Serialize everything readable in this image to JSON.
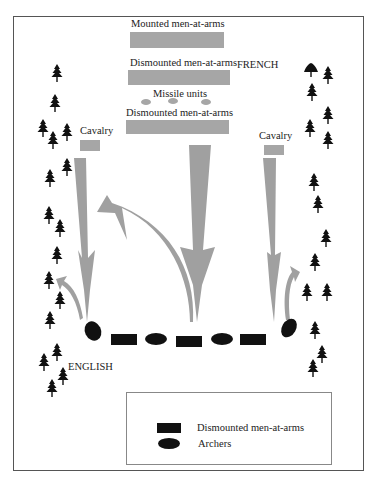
{
  "diagram": {
    "type": "battle-map",
    "colors": {
      "french_units": "#a6a6a6",
      "english_units": "#111111",
      "arrows": "#a0a0a0",
      "trees": "#111111",
      "frame": "#555555"
    },
    "french": {
      "side_label": "FRENCH",
      "lines": [
        {
          "label": "Mounted men-at-arms"
        },
        {
          "label": "Dismounted men-at-arms"
        },
        {
          "label": "Missile units"
        },
        {
          "label": "Dismounted men-at-arms"
        }
      ],
      "left_wing": {
        "label": "Cavalry"
      },
      "right_wing": {
        "label": "Cavalry"
      }
    },
    "english": {
      "side_label": "ENGLISH",
      "line": [
        "archers",
        "men-at-arms",
        "archers",
        "men-at-arms",
        "archers",
        "men-at-arms",
        "archers"
      ]
    },
    "legend": {
      "items": [
        {
          "symbol": "rectangle",
          "label": "Dismounted men-at-arms"
        },
        {
          "symbol": "ellipse",
          "label": "Archers"
        }
      ]
    },
    "trees": {
      "left": [
        [
          57,
          73
        ],
        [
          55,
          103
        ],
        [
          43,
          128
        ],
        [
          53,
          140
        ],
        [
          67,
          132
        ],
        [
          67,
          165
        ],
        [
          50,
          178
        ],
        [
          49,
          215
        ],
        [
          60,
          228
        ],
        [
          57,
          255
        ],
        [
          49,
          280
        ],
        [
          60,
          300
        ],
        [
          50,
          320
        ],
        [
          57,
          352
        ],
        [
          44,
          362
        ],
        [
          63,
          376
        ],
        [
          52,
          388
        ]
      ],
      "right": [
        [
          311,
          68
        ],
        [
          328,
          75
        ],
        [
          312,
          90
        ],
        [
          328,
          115
        ],
        [
          310,
          128
        ],
        [
          328,
          140
        ],
        [
          314,
          180
        ],
        [
          318,
          202
        ],
        [
          326,
          238
        ],
        [
          315,
          262
        ],
        [
          307,
          292
        ],
        [
          327,
          292
        ],
        [
          315,
          330
        ],
        [
          322,
          354
        ],
        [
          313,
          368
        ]
      ]
    }
  }
}
